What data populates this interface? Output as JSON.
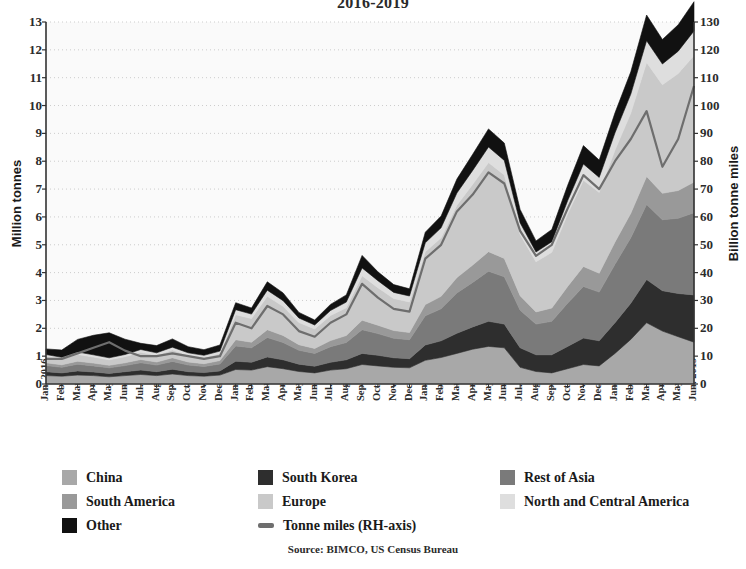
{
  "chart_data": {
    "type": "area",
    "title": "2016-2019",
    "subtitle": "",
    "xlabel": "",
    "ylabel": "Million tonnes",
    "y2label": "Billion tonne miles",
    "ylim": [
      0,
      13
    ],
    "y2lim": [
      0,
      130
    ],
    "yticks": [
      0,
      1,
      2,
      3,
      4,
      5,
      6,
      7,
      8,
      9,
      10,
      11,
      12,
      13
    ],
    "y2ticks": [
      0,
      10,
      20,
      30,
      40,
      50,
      60,
      70,
      80,
      90,
      100,
      110,
      120,
      130
    ],
    "grid": true,
    "stacked": true,
    "legend_position": "bottom",
    "source": "Source: BIMCO, US Census Bureau",
    "categories": [
      "Jan. 2016",
      "Feb. 2016",
      "Mar. 2016",
      "Apr. 2016",
      "May 2016",
      "Jun. 2016",
      "Jul. 2016",
      "Aug. 2016",
      "Sep. 2016",
      "Oct. 2016",
      "Nov. 2016",
      "Dec. 2016",
      "Jan. 2017",
      "Feb. 2017",
      "Mar. 2017",
      "Apr. 2017",
      "May 2017",
      "Jun. 2017",
      "Jul. 2017",
      "Aug. 2017",
      "Sep. 2017",
      "Oct. 2017",
      "Nov. 2017",
      "Dec. 2017",
      "Jan. 2018",
      "Feb. 2018",
      "Mar. 2018",
      "Apr. 2018",
      "May 2018",
      "Jun. 2018",
      "Jul. 2018",
      "Aug. 2018",
      "Sep. 2018",
      "Oct. 2018",
      "Nov. 2018",
      "Dec. 2018",
      "Jan. 2019",
      "Feb. 2019",
      "Mar. 2019",
      "Apr. 2019",
      "May 2019",
      "Jun. 2019"
    ],
    "series": [
      {
        "name": "China",
        "color": "#a8a8a8",
        "values": [
          0.3,
          0.28,
          0.32,
          0.3,
          0.26,
          0.3,
          0.34,
          0.3,
          0.36,
          0.3,
          0.28,
          0.32,
          0.52,
          0.5,
          0.62,
          0.55,
          0.45,
          0.4,
          0.5,
          0.55,
          0.7,
          0.65,
          0.6,
          0.58,
          0.85,
          0.95,
          1.1,
          1.25,
          1.35,
          1.3,
          0.6,
          0.45,
          0.4,
          0.55,
          0.7,
          0.65,
          1.1,
          1.6,
          2.2,
          1.9,
          1.7,
          1.5
        ]
      },
      {
        "name": "South Korea",
        "color": "#2e2e2e",
        "values": [
          0.14,
          0.12,
          0.15,
          0.13,
          0.12,
          0.14,
          0.16,
          0.14,
          0.17,
          0.14,
          0.13,
          0.15,
          0.3,
          0.28,
          0.35,
          0.32,
          0.26,
          0.24,
          0.28,
          0.32,
          0.4,
          0.38,
          0.34,
          0.33,
          0.55,
          0.6,
          0.72,
          0.8,
          0.9,
          0.85,
          0.7,
          0.6,
          0.65,
          0.8,
          0.95,
          0.9,
          1.1,
          1.3,
          1.55,
          1.45,
          1.55,
          1.7
        ]
      },
      {
        "name": "Rest of Asia",
        "color": "#7a7a7a",
        "values": [
          0.22,
          0.2,
          0.24,
          0.22,
          0.2,
          0.22,
          0.26,
          0.24,
          0.28,
          0.24,
          0.22,
          0.25,
          0.55,
          0.52,
          0.7,
          0.62,
          0.5,
          0.46,
          0.56,
          0.62,
          0.85,
          0.78,
          0.7,
          0.68,
          1.05,
          1.15,
          1.45,
          1.6,
          1.8,
          1.7,
          1.35,
          1.1,
          1.2,
          1.55,
          1.85,
          1.75,
          2.1,
          2.35,
          2.7,
          2.55,
          2.7,
          2.95
        ]
      },
      {
        "name": "South America",
        "color": "#999999",
        "values": [
          0.1,
          0.09,
          0.11,
          0.1,
          0.09,
          0.1,
          0.12,
          0.11,
          0.13,
          0.11,
          0.1,
          0.12,
          0.22,
          0.2,
          0.28,
          0.25,
          0.2,
          0.18,
          0.22,
          0.25,
          0.34,
          0.3,
          0.28,
          0.26,
          0.4,
          0.45,
          0.55,
          0.62,
          0.7,
          0.66,
          0.52,
          0.44,
          0.48,
          0.6,
          0.72,
          0.68,
          0.8,
          0.88,
          1.0,
          0.95,
          1.0,
          1.1
        ]
      },
      {
        "name": "Europe",
        "color": "#c9c9c9",
        "values": [
          0.22,
          0.2,
          0.24,
          0.22,
          0.2,
          0.22,
          0.26,
          0.24,
          0.28,
          0.24,
          0.22,
          0.25,
          0.9,
          0.85,
          1.2,
          1.05,
          0.8,
          0.7,
          0.9,
          1.0,
          1.6,
          1.35,
          1.15,
          1.1,
          1.9,
          2.1,
          2.6,
          2.9,
          3.2,
          3.0,
          2.2,
          1.8,
          2.0,
          2.6,
          3.1,
          2.9,
          3.3,
          3.6,
          4.1,
          3.9,
          4.2,
          4.55
        ]
      },
      {
        "name": "North and Central America",
        "color": "#dedede",
        "values": [
          0.08,
          0.07,
          0.09,
          0.08,
          0.07,
          0.08,
          0.1,
          0.09,
          0.1,
          0.09,
          0.08,
          0.09,
          0.18,
          0.16,
          0.22,
          0.2,
          0.16,
          0.14,
          0.18,
          0.2,
          0.28,
          0.25,
          0.22,
          0.21,
          0.32,
          0.36,
          0.44,
          0.5,
          0.56,
          0.52,
          0.42,
          0.35,
          0.38,
          0.48,
          0.58,
          0.54,
          0.62,
          0.68,
          0.78,
          0.74,
          0.8,
          0.88
        ]
      },
      {
        "name": "Other",
        "color": "#111111",
        "values": [
          0.2,
          0.26,
          0.45,
          0.7,
          0.9,
          0.55,
          0.22,
          0.26,
          0.3,
          0.22,
          0.2,
          0.22,
          0.25,
          0.22,
          0.3,
          0.28,
          0.2,
          0.18,
          0.22,
          0.26,
          0.45,
          0.32,
          0.28,
          0.26,
          0.38,
          0.42,
          0.5,
          0.58,
          0.65,
          0.62,
          0.48,
          0.4,
          0.44,
          0.55,
          0.66,
          0.62,
          0.72,
          0.8,
          0.92,
          0.88,
          0.95,
          1.05
        ]
      }
    ],
    "line_series": {
      "name": "Tonne miles (RH-axis)",
      "color": "#6e6e6e",
      "axis": "right",
      "values": [
        9,
        9,
        11,
        13,
        15,
        12,
        10,
        10,
        11,
        10,
        9,
        10,
        22,
        20,
        28,
        25,
        19,
        17,
        22,
        25,
        36,
        31,
        27,
        26,
        45,
        50,
        62,
        68,
        76,
        72,
        55,
        46,
        50,
        63,
        75,
        70,
        80,
        88,
        98,
        78,
        88,
        107
      ]
    }
  },
  "legend": {
    "rows": [
      [
        {
          "label": "China",
          "swatch": "#a8a8a8",
          "type": "area"
        },
        {
          "label": "South Korea",
          "swatch": "#2e2e2e",
          "type": "area"
        },
        {
          "label": "Rest of Asia",
          "swatch": "#7a7a7a",
          "type": "area"
        }
      ],
      [
        {
          "label": "South America",
          "swatch": "#999999",
          "type": "area"
        },
        {
          "label": "Europe",
          "swatch": "#c9c9c9",
          "type": "area"
        },
        {
          "label": "North and Central America",
          "swatch": "#dedede",
          "type": "area"
        }
      ],
      [
        {
          "label": "Other",
          "swatch": "#111111",
          "type": "area"
        },
        {
          "label": "Tonne miles (RH-axis)",
          "swatch": "#6e6e6e",
          "type": "line"
        }
      ]
    ]
  }
}
